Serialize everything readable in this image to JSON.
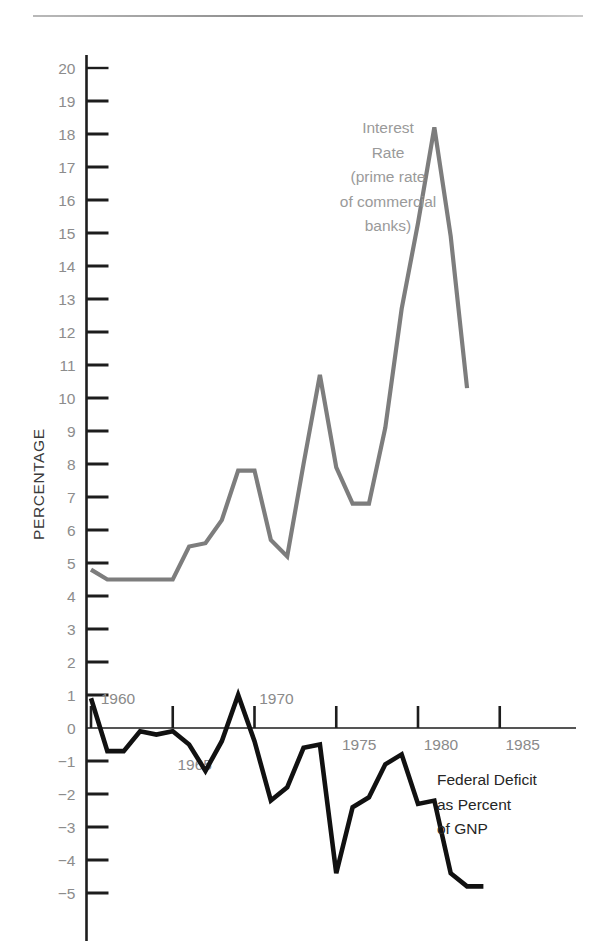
{
  "chart_data": {
    "type": "line",
    "title": "",
    "xlabel": "",
    "ylabel": "PERCENTAGE",
    "xlim": [
      1959.2,
      1986.5
    ],
    "ylim": [
      -5,
      20
    ],
    "grid": false,
    "legend_position": "inline-annotations",
    "y_ticks": [
      20,
      19,
      18,
      17,
      16,
      15,
      14,
      13,
      12,
      11,
      10,
      9,
      8,
      7,
      6,
      5,
      4,
      3,
      2,
      1,
      0,
      -1,
      -2,
      -3,
      -4,
      -5
    ],
    "y_tick_labels": [
      "20",
      "19",
      "18",
      "17",
      "16",
      "15",
      "14",
      "13",
      "12",
      "11",
      "10",
      "9",
      "8",
      "7",
      "6",
      "5",
      "4",
      "3",
      "2",
      "1",
      "0",
      "−1",
      "−2",
      "−3",
      "−4",
      "−5"
    ],
    "x_ticks": [
      1960,
      1965,
      1970,
      1975,
      1980,
      1985
    ],
    "x_tick_labels": [
      "1960",
      "1965",
      "1970",
      "1975",
      "1980",
      "1985"
    ],
    "series": [
      {
        "name": "Interest Rate (prime rate of commercial banks)",
        "color": "#7d7d7d",
        "annotation_lines": [
          "Interest",
          "Rate",
          "(prime rate",
          "of commercial",
          "banks)"
        ],
        "x": [
          1960,
          1961,
          1962,
          1963,
          1964,
          1965,
          1966,
          1967,
          1968,
          1969,
          1970,
          1971,
          1972,
          1973,
          1974,
          1975,
          1976,
          1977,
          1978,
          1979,
          1980,
          1981,
          1982,
          1983
        ],
        "values": [
          4.8,
          4.5,
          4.5,
          4.5,
          4.5,
          4.5,
          5.5,
          5.6,
          6.3,
          7.8,
          7.8,
          5.7,
          5.2,
          8.0,
          10.7,
          7.9,
          6.8,
          6.8,
          9.1,
          12.7,
          15.3,
          18.2,
          14.9,
          10.3
        ]
      },
      {
        "name": "Federal Deficit as Percent of GNP",
        "color": "#111111",
        "annotation_lines": [
          "Federal Deficit",
          "as Percent",
          "of GNP"
        ],
        "x": [
          1960,
          1961,
          1962,
          1963,
          1964,
          1965,
          1966,
          1967,
          1968,
          1969,
          1970,
          1971,
          1972,
          1973,
          1974,
          1975,
          1976,
          1977,
          1978,
          1979,
          1980,
          1981,
          1982,
          1983,
          1984
        ],
        "values": [
          0.9,
          -0.7,
          -0.7,
          -0.1,
          -0.2,
          -0.1,
          -0.5,
          -1.3,
          -0.4,
          1.0,
          -0.4,
          -2.2,
          -1.8,
          -0.6,
          -0.5,
          -4.4,
          -2.4,
          -2.1,
          -1.1,
          -0.8,
          -2.3,
          -2.2,
          -4.4,
          -4.8,
          -4.8
        ]
      }
    ]
  },
  "axis": {
    "y_title": "PERCENTAGE"
  }
}
